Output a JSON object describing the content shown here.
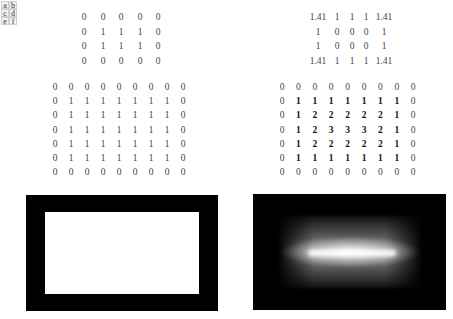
{
  "legend": {
    "letters": [
      "a",
      "b",
      "c",
      "d",
      "e",
      "f"
    ]
  },
  "matrix_binary_small": {
    "rows": [
      [
        "0",
        "0",
        "0",
        "0",
        "0"
      ],
      [
        "0",
        "1",
        "1",
        "1",
        "0"
      ],
      [
        "0",
        "1",
        "1",
        "1",
        "0"
      ],
      [
        "0",
        "0",
        "0",
        "0",
        "0"
      ]
    ]
  },
  "matrix_distance_small": {
    "rows": [
      [
        "1.41",
        "1",
        "1",
        "1",
        "1.41"
      ],
      [
        "1",
        "0",
        "0",
        "0",
        "1"
      ],
      [
        "1",
        "0",
        "0",
        "0",
        "1"
      ],
      [
        "1.41",
        "1",
        "1",
        "1",
        "1.41"
      ]
    ]
  },
  "matrix_binary_large": {
    "rows": [
      [
        "0",
        "0",
        "0",
        "0",
        "0",
        "0",
        "0",
        "0",
        "0"
      ],
      [
        "0",
        "1",
        "1",
        "1",
        "1",
        "1",
        "1",
        "1",
        "0"
      ],
      [
        "0",
        "1",
        "1",
        "1",
        "1",
        "1",
        "1",
        "1",
        "0"
      ],
      [
        "0",
        "1",
        "1",
        "1",
        "1",
        "1",
        "1",
        "1",
        "0"
      ],
      [
        "0",
        "1",
        "1",
        "1",
        "1",
        "1",
        "1",
        "1",
        "0"
      ],
      [
        "0",
        "1",
        "1",
        "1",
        "1",
        "1",
        "1",
        "1",
        "0"
      ],
      [
        "0",
        "0",
        "0",
        "0",
        "0",
        "0",
        "0",
        "0",
        "0"
      ]
    ]
  },
  "matrix_distance_large": {
    "rows": [
      [
        "0",
        "0",
        "0",
        "0",
        "0",
        "0",
        "0",
        "0",
        "0"
      ],
      [
        "0",
        "1",
        "1",
        "1",
        "1",
        "1",
        "1",
        "1",
        "0"
      ],
      [
        "0",
        "1",
        "2",
        "2",
        "2",
        "2",
        "2",
        "1",
        "0"
      ],
      [
        "0",
        "1",
        "2",
        "3",
        "3",
        "3",
        "2",
        "1",
        "0"
      ],
      [
        "0",
        "1",
        "2",
        "2",
        "2",
        "2",
        "2",
        "1",
        "0"
      ],
      [
        "0",
        "1",
        "1",
        "1",
        "1",
        "1",
        "1",
        "1",
        "0"
      ],
      [
        "0",
        "0",
        "0",
        "0",
        "0",
        "0",
        "0",
        "0",
        "0"
      ]
    ]
  },
  "images": {
    "binary_rectangle": {
      "description": "black frame with white rectangle interior"
    },
    "distance_transform": {
      "description": "grayscale distance map with bright central ridge"
    }
  }
}
